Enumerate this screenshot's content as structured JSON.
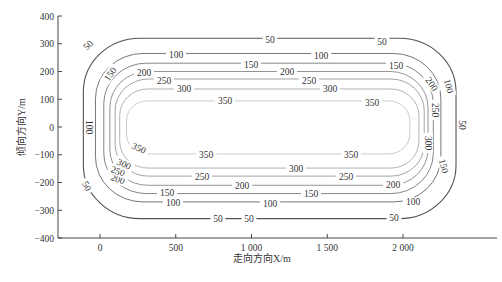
{
  "chart_data": {
    "type": "contour",
    "title": "",
    "xlabel": "走向方向X/m",
    "ylabel": "倾向方向Y/m",
    "xlim": [
      -300,
      2250
    ],
    "ylim": [
      -400,
      400
    ],
    "x_ticks": [
      {
        "value": 0,
        "label": "0"
      },
      {
        "value": 500,
        "label": "500"
      },
      {
        "value": 1000,
        "label": "1 000"
      },
      {
        "value": 1500,
        "label": "1 500"
      },
      {
        "value": 2000,
        "label": "2 000"
      }
    ],
    "y_ticks": [
      {
        "value": 400,
        "label": "400"
      },
      {
        "value": 300,
        "label": "300"
      },
      {
        "value": 200,
        "label": "200"
      },
      {
        "value": 100,
        "label": "100"
      },
      {
        "value": 0,
        "label": "0"
      },
      {
        "value": -100,
        "label": "-100"
      },
      {
        "value": -200,
        "label": "-200"
      },
      {
        "value": -300,
        "label": "-300"
      },
      {
        "value": -400,
        "label": "-400"
      }
    ],
    "grid": false,
    "legend": "none",
    "contour_levels": [
      50,
      100,
      150,
      200,
      250,
      300,
      350
    ],
    "contours": [
      {
        "level": 50,
        "x_min": -110,
        "x_max": 2350,
        "y_min": -330,
        "y_max": 320,
        "color": "#555555"
      },
      {
        "level": 100,
        "x_min": -30,
        "x_max": 2250,
        "y_min": -270,
        "y_max": 265,
        "color": "#666666"
      },
      {
        "level": 150,
        "x_min": 25,
        "x_max": 2200,
        "y_min": -240,
        "y_max": 230,
        "color": "#777777"
      },
      {
        "level": 200,
        "x_min": 65,
        "x_max": 2165,
        "y_min": -210,
        "y_max": 200,
        "color": "#888888"
      },
      {
        "level": 250,
        "x_min": 100,
        "x_max": 2140,
        "y_min": -177,
        "y_max": 173,
        "color": "#999999"
      },
      {
        "level": 300,
        "x_min": 130,
        "x_max": 2105,
        "y_min": -148,
        "y_max": 137,
        "color": "#aaaaaa"
      },
      {
        "level": 350,
        "x_min": 175,
        "x_max": 2045,
        "y_min": -97,
        "y_max": 94,
        "color": "#c4c4c4"
      }
    ],
    "contour_labels": [
      {
        "text": "50",
        "x": 88,
        "y": 45,
        "rot": -45
      },
      {
        "text": "50",
        "x": 270,
        "y": 40,
        "rot": 0
      },
      {
        "text": "50",
        "x": 382,
        "y": 42,
        "rot": 0
      },
      {
        "text": "50",
        "x": 462,
        "y": 125,
        "rot": 90
      },
      {
        "text": "50",
        "x": 87,
        "y": 186,
        "rot": 60
      },
      {
        "text": "50",
        "x": 218,
        "y": 219,
        "rot": 0
      },
      {
        "text": "50",
        "x": 249,
        "y": 219,
        "rot": 0
      },
      {
        "text": "50",
        "x": 394,
        "y": 218,
        "rot": 0
      },
      {
        "text": "100",
        "x": 176,
        "y": 55,
        "rot": 0
      },
      {
        "text": "100",
        "x": 321,
        "y": 56,
        "rot": 0
      },
      {
        "text": "100",
        "x": 449,
        "y": 86,
        "rot": 75
      },
      {
        "text": "100",
        "x": 89,
        "y": 127,
        "rot": 90
      },
      {
        "text": "100",
        "x": 173,
        "y": 203,
        "rot": 0
      },
      {
        "text": "100",
        "x": 270,
        "y": 204,
        "rot": 0
      },
      {
        "text": "100",
        "x": 413,
        "y": 202,
        "rot": 0
      },
      {
        "text": "150",
        "x": 110,
        "y": 74,
        "rot": -55
      },
      {
        "text": "150",
        "x": 251,
        "y": 65,
        "rot": 0
      },
      {
        "text": "150",
        "x": 396,
        "y": 66,
        "rot": 0
      },
      {
        "text": "150",
        "x": 167,
        "y": 193,
        "rot": 0
      },
      {
        "text": "150",
        "x": 311,
        "y": 194,
        "rot": 0
      },
      {
        "text": "150",
        "x": 444,
        "y": 166,
        "rot": 75
      },
      {
        "text": "200",
        "x": 144,
        "y": 73,
        "rot": 0
      },
      {
        "text": "200",
        "x": 287,
        "y": 72,
        "rot": 0
      },
      {
        "text": "200",
        "x": 432,
        "y": 84,
        "rot": 55
      },
      {
        "text": "200",
        "x": 118,
        "y": 179,
        "rot": 20
      },
      {
        "text": "200",
        "x": 242,
        "y": 186,
        "rot": 0
      },
      {
        "text": "200",
        "x": 393,
        "y": 185,
        "rot": 0
      },
      {
        "text": "250",
        "x": 164,
        "y": 81,
        "rot": 0
      },
      {
        "text": "250",
        "x": 309,
        "y": 81,
        "rot": 0
      },
      {
        "text": "250",
        "x": 435,
        "y": 110,
        "rot": 90
      },
      {
        "text": "250",
        "x": 118,
        "y": 171,
        "rot": 20
      },
      {
        "text": "250",
        "x": 202,
        "y": 177,
        "rot": 0
      },
      {
        "text": "250",
        "x": 346,
        "y": 177,
        "rot": 0
      },
      {
        "text": "300",
        "x": 184,
        "y": 89,
        "rot": 0
      },
      {
        "text": "300",
        "x": 330,
        "y": 89,
        "rot": 0
      },
      {
        "text": "300",
        "x": 428,
        "y": 143,
        "rot": 90
      },
      {
        "text": "300",
        "x": 124,
        "y": 164,
        "rot": 25
      },
      {
        "text": "300",
        "x": 296,
        "y": 169,
        "rot": 0
      },
      {
        "text": "350",
        "x": 225,
        "y": 101,
        "rot": 0
      },
      {
        "text": "350",
        "x": 372,
        "y": 103,
        "rot": 0
      },
      {
        "text": "350",
        "x": 139,
        "y": 148,
        "rot": 25
      },
      {
        "text": "350",
        "x": 206,
        "y": 155,
        "rot": 0
      },
      {
        "text": "350",
        "x": 351,
        "y": 155,
        "rot": 0
      }
    ]
  }
}
